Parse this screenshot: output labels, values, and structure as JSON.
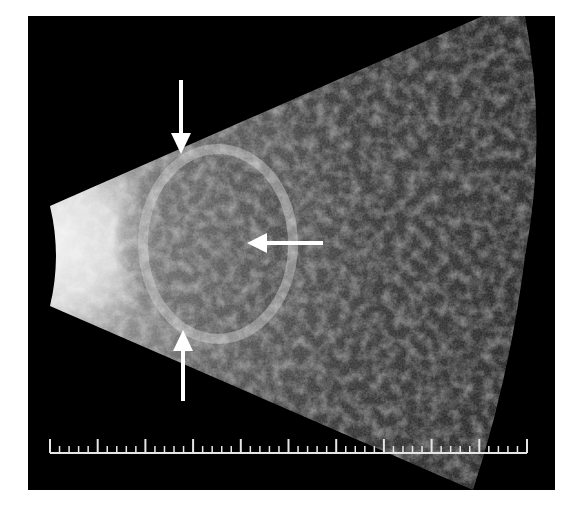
{
  "image": {
    "type": "ophthalmic B-scan ultrasound",
    "background_color": "#000000",
    "page_color": "#ffffff"
  },
  "annotations": {
    "arrows": [
      {
        "id": "arrow-top",
        "direction": "down",
        "color": "#ffffff"
      },
      {
        "id": "arrow-right",
        "direction": "left",
        "color": "#ffffff"
      },
      {
        "id": "arrow-bottom",
        "direction": "up",
        "color": "#ffffff"
      }
    ]
  },
  "scale_bar": {
    "major_ticks": 10,
    "minor_per_major": 5,
    "color": "#e6e6e6"
  }
}
